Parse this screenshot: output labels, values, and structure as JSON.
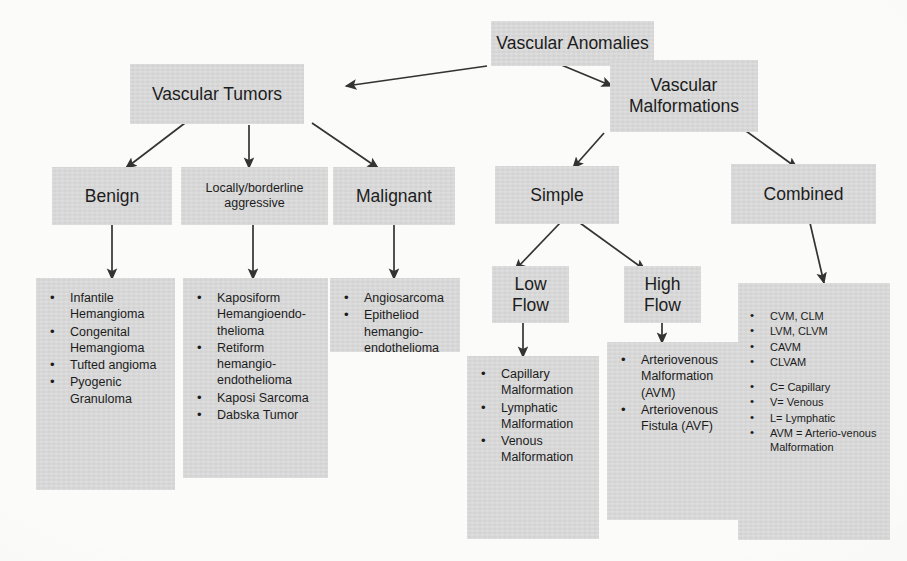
{
  "diagram": {
    "title": "Vascular Anomalies",
    "nodes": {
      "root": "Vascular Anomalies",
      "tumors": "Vascular Tumors",
      "malformations": "Vascular\nMalformations",
      "malformations_l1": "Vascular",
      "malformations_l2": "Malformations",
      "benign": "Benign",
      "locally_l1": "Locally/borderline",
      "locally_l2": "aggressive",
      "malignant": "Malignant",
      "simple": "Simple",
      "combined": "Combined",
      "low_flow_l1": "Low",
      "low_flow_l2": "Flow",
      "high_flow_l1": "High",
      "high_flow_l2": "Flow"
    },
    "lists": {
      "benign": [
        "Infantile Hemangioma",
        "Congenital Hemangioma",
        "Tufted angioma",
        "Pyogenic Granuloma"
      ],
      "locally_aggressive": [
        "Kaposiform Hemangioendo-thelioma",
        "Retiform hemangio-endothelioma",
        "Kaposi Sarcoma",
        "Dabska Tumor"
      ],
      "malignant": [
        "Angiosarcoma",
        "Epitheliod hemangio-endothelioma"
      ],
      "low_flow": [
        "Capillary Malformation",
        "Lymphatic Malformation",
        "Venous Malformation"
      ],
      "high_flow": [
        "Arteriovenous Malformation (AVM)",
        "Arteriovenous Fistula (AVF)"
      ],
      "combined": [
        "CVM, CLM",
        "LVM, CLVM",
        "CAVM",
        "CLVAM"
      ],
      "combined_legend": [
        "C= Capillary",
        "V= Venous",
        "L= Lymphatic",
        "AVM = Arterio-venous Malformation"
      ]
    },
    "colors": {
      "box_fill": "#d9d9d9",
      "text": "#1c1c1c",
      "arrow": "#333333",
      "background": "#fdfdfc"
    }
  }
}
